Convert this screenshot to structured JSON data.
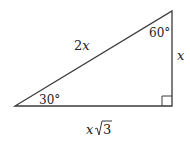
{
  "diagram": {
    "type": "right-triangle",
    "colors": {
      "stroke": "#3a3a3a",
      "text": "#222222",
      "background": "#ffffff"
    },
    "angles": {
      "top": "60°",
      "bottom_left": "30°",
      "bottom_right": "right-angle"
    },
    "sides": {
      "hypotenuse": {
        "coef": "2",
        "var": "x"
      },
      "vertical": {
        "var": "x"
      },
      "horizontal": {
        "var": "x",
        "radical": "√",
        "radicand": "3"
      }
    }
  }
}
